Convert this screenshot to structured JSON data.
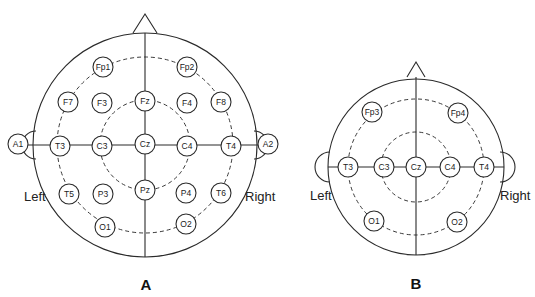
{
  "figure": {
    "panels": [
      {
        "id": "A",
        "label": "A",
        "left_label": "Left",
        "right_label": "Right",
        "electrodes": {
          "fp1": "Fp1",
          "fp2": "Fp2",
          "f7": "F7",
          "f3": "F3",
          "fz": "Fz",
          "f4": "F4",
          "f8": "F8",
          "a1": "A1",
          "t3": "T3",
          "c3": "C3",
          "cz": "Cz",
          "c4": "C4",
          "t4": "T4",
          "a2": "A2",
          "t5": "T5",
          "p3": "P3",
          "pz": "Pz",
          "p4": "P4",
          "t6": "T6",
          "o1": "O1",
          "o2": "O2"
        }
      },
      {
        "id": "B",
        "label": "B",
        "left_label": "Left",
        "right_label": "Right",
        "electrodes": {
          "fp3": "Fp3",
          "fp4": "Fp4",
          "t3": "T3",
          "c3": "C3",
          "cz": "Cz",
          "c4": "C4",
          "t4": "T4",
          "o1": "O1",
          "o2": "O2"
        }
      }
    ]
  }
}
